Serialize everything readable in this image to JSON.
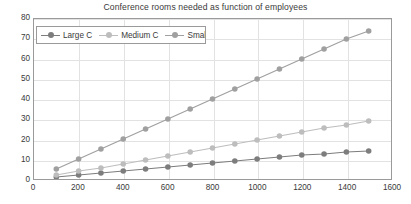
{
  "chart_data": {
    "type": "line",
    "title": "Conference rooms needed as function of employees",
    "xlabel": "",
    "ylabel": "",
    "xlim": [
      0,
      1600
    ],
    "ylim": [
      0,
      80
    ],
    "xticks": [
      0,
      200,
      400,
      600,
      800,
      1000,
      1200,
      1400,
      1600
    ],
    "yticks": [
      0,
      10,
      20,
      30,
      40,
      50,
      60,
      70,
      80
    ],
    "grid": true,
    "legend_position": "top-left",
    "x": [
      100,
      200,
      300,
      400,
      500,
      600,
      700,
      800,
      900,
      1000,
      1100,
      1200,
      1300,
      1400,
      1500
    ],
    "series": [
      {
        "name": "Large C",
        "color": "#7d7d7d",
        "values": [
          1,
          2,
          3,
          4,
          5,
          6,
          7,
          8,
          9,
          10,
          11,
          12,
          12.5,
          13.5,
          14
        ]
      },
      {
        "name": "Medium C",
        "color": "#bdbdbd",
        "values": [
          2,
          4,
          5.5,
          7.5,
          9.5,
          11.5,
          13.5,
          15.5,
          17.5,
          19.5,
          21.5,
          23.5,
          25.5,
          27,
          29
        ]
      },
      {
        "name": "Small C",
        "color": "#a0a0a0",
        "values": [
          5,
          10,
          15,
          20,
          25,
          30,
          35,
          40,
          45,
          50,
          55,
          60,
          65,
          70,
          74
        ]
      }
    ]
  },
  "legend": {
    "items": [
      {
        "label": "Large C"
      },
      {
        "label": "Medium C"
      },
      {
        "label": "Small C"
      }
    ]
  }
}
